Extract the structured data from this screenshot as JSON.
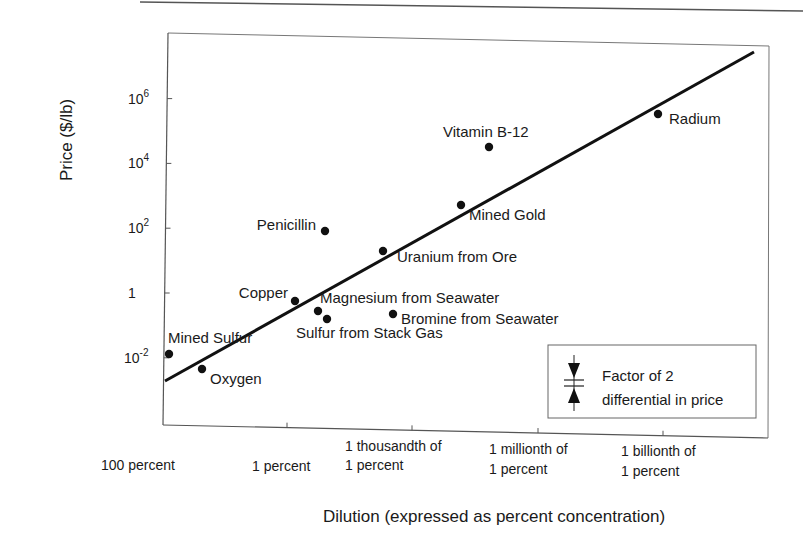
{
  "chart_data": {
    "type": "scatter",
    "title": "",
    "xlabel": "Dilution (expressed as percent concentration)",
    "ylabel": "Price ($/lb)",
    "yscale": "log",
    "ylim": [
      0.0001,
      100000000
    ],
    "grid": false,
    "legend_position": "lower right (inside plot)",
    "y_ticks": [
      {
        "label_base": "10",
        "label_exp": "6",
        "value": 1000000
      },
      {
        "label_base": "10",
        "label_exp": "4",
        "value": 10000
      },
      {
        "label_base": "10",
        "label_exp": "2",
        "value": 100
      },
      {
        "label_base": "1",
        "label_exp": "",
        "value": 1
      },
      {
        "label_base": "10",
        "label_exp": "-2",
        "value": 0.01
      }
    ],
    "x_ticks": [
      {
        "line1": "",
        "line2": "100 percent",
        "percent": 100
      },
      {
        "line1": "",
        "line2": "1 percent",
        "percent": 1
      },
      {
        "line1": "1 thousandth of",
        "line2": "1 percent",
        "percent": 0.001
      },
      {
        "line1": "1 millionth of",
        "line2": "1 percent",
        "percent": 1e-06
      },
      {
        "line1": "1 billionth of",
        "line2": "1 percent",
        "percent": 1e-09
      }
    ],
    "points": [
      {
        "name": "Mined Sulfur",
        "concentration_percent": 90,
        "price": 0.012
      },
      {
        "name": "Oxygen",
        "concentration_percent": 21,
        "price": 0.003
      },
      {
        "name": "Copper",
        "concentration_percent": 0.5,
        "price": 0.6
      },
      {
        "name": "Magnesium from Seawater",
        "concentration_percent": 0.13,
        "price": 0.3
      },
      {
        "name": "Sulfur from Stack Gas",
        "concentration_percent": 0.1,
        "price": 0.15
      },
      {
        "name": "Penicillin",
        "concentration_percent": 0.1,
        "price": 80
      },
      {
        "name": "Bromine from Seawater",
        "concentration_percent": 0.0065,
        "price": 0.2
      },
      {
        "name": "Uranium from Ore",
        "concentration_percent": 0.01,
        "price": 20
      },
      {
        "name": "Mined Gold",
        "concentration_percent": 1e-05,
        "price": 500
      },
      {
        "name": "Vitamin B-12",
        "concentration_percent": 2e-06,
        "price": 30000
      },
      {
        "name": "Radium",
        "concentration_percent": 1e-09,
        "price": 300000
      }
    ],
    "trend_line": {
      "description": "Best-fit line, price rises with dilution",
      "from": {
        "concentration_percent": 100,
        "price": 0.002
      },
      "to": {
        "concentration_percent": 1e-10,
        "price": 20000000
      }
    },
    "legend": {
      "line1": "Factor of 2",
      "line2": "differential in price"
    }
  },
  "ui": {
    "y_axis_title": "Price ($/lb)",
    "x_axis_title": "Dilution (expressed as percent concentration)",
    "legend_line1": "Factor of 2",
    "legend_line2": "differential in price"
  }
}
